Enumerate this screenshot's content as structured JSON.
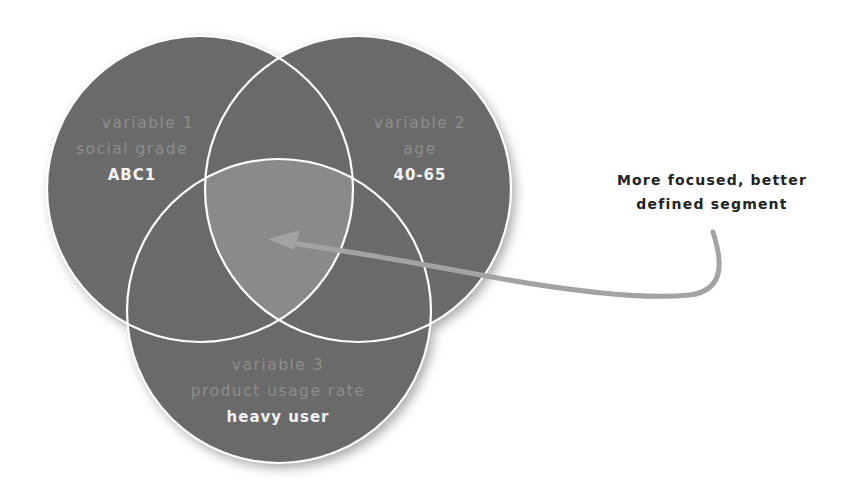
{
  "diagram": {
    "type": "venn",
    "colors": {
      "circle_fill": "#6b6b6b",
      "intersection_fill": "#8a8a8a",
      "outline": "#ffffff",
      "arrow": "#a3a3a3",
      "variable_text": "#8d8d8d",
      "value_text": "#f4f4f4",
      "annotation_text": "#222222"
    },
    "circles": [
      {
        "id": "variable-1",
        "variable": "variable 1",
        "dimension": "social grade",
        "value": "ABC1"
      },
      {
        "id": "variable-2",
        "variable": "variable 2",
        "dimension": "age",
        "value": "40-65"
      },
      {
        "id": "variable-3",
        "variable": "variable 3",
        "dimension": "product usage rate",
        "value": "heavy user"
      }
    ],
    "annotation": {
      "line1": "More focused, better",
      "line2": "defined segment",
      "points_to": "intersection of all three variables"
    }
  }
}
